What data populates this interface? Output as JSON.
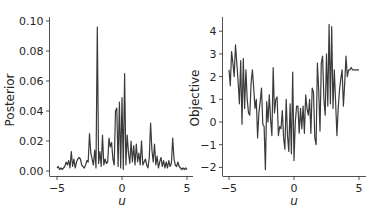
{
  "figure": {
    "title": "",
    "background": "#ffffff",
    "line_color": "#3a3a3a"
  },
  "chart_data": [
    {
      "type": "line",
      "title": "",
      "xlabel": "u",
      "ylabel": "Posterior",
      "xlim": [
        -5.1,
        5.2
      ],
      "ylim": [
        -0.002,
        0.1
      ],
      "xticks": [
        -5,
        0,
        5
      ],
      "xtick_labels": [
        "−5",
        "0",
        "5"
      ],
      "yticks": [
        0.0,
        0.02,
        0.04,
        0.06,
        0.08,
        0.1
      ],
      "ytick_labels": [
        "0.00",
        "0.02",
        "0.04",
        "0.06",
        "0.08",
        "0.10"
      ],
      "grid": false,
      "legend": null,
      "x": [
        -5.0,
        -4.9,
        -4.8,
        -4.7,
        -4.6,
        -4.5,
        -4.4,
        -4.3,
        -4.2,
        -4.1,
        -4.0,
        -3.9,
        -3.8,
        -3.7,
        -3.6,
        -3.5,
        -3.4,
        -3.3,
        -3.2,
        -3.1,
        -3.0,
        -2.9,
        -2.8,
        -2.7,
        -2.6,
        -2.5,
        -2.4,
        -2.3,
        -2.2,
        -2.1,
        -2.0,
        -1.9,
        -1.8,
        -1.7,
        -1.6,
        -1.5,
        -1.4,
        -1.3,
        -1.2,
        -1.1,
        -1.0,
        -0.9,
        -0.8,
        -0.7,
        -0.6,
        -0.5,
        -0.4,
        -0.3,
        -0.2,
        -0.1,
        0.0,
        0.1,
        0.2,
        0.3,
        0.4,
        0.5,
        0.6,
        0.7,
        0.8,
        0.9,
        1.0,
        1.1,
        1.2,
        1.3,
        1.4,
        1.5,
        1.6,
        1.7,
        1.8,
        1.9,
        2.0,
        2.1,
        2.2,
        2.3,
        2.4,
        2.5,
        2.6,
        2.7,
        2.8,
        2.9,
        3.0,
        3.1,
        3.2,
        3.3,
        3.4,
        3.5,
        3.6,
        3.7,
        3.8,
        3.9,
        4.0,
        4.1,
        4.2,
        4.3,
        4.4,
        4.5,
        4.6,
        4.7,
        4.8,
        4.9,
        5.0
      ],
      "values": [
        0.002,
        0.003,
        0.001,
        0.002,
        0.001,
        0.002,
        0.003,
        0.006,
        0.004,
        0.007,
        0.002,
        0.013,
        0.003,
        0.008,
        0.002,
        0.006,
        0.008,
        0.009,
        0.008,
        0.004,
        0.003,
        0.002,
        0.004,
        0.007,
        0.006,
        0.025,
        0.012,
        0.008,
        0.004,
        0.014,
        0.002,
        0.096,
        0.005,
        0.013,
        0.003,
        0.024,
        0.004,
        0.008,
        0.005,
        0.006,
        0.022,
        0.016,
        0.019,
        0.008,
        0.004,
        0.04,
        0.042,
        0.003,
        0.046,
        0.002,
        0.049,
        0.001,
        0.065,
        0.004,
        0.024,
        0.012,
        0.005,
        0.02,
        0.006,
        0.017,
        0.004,
        0.018,
        0.006,
        0.012,
        0.004,
        0.02,
        0.004,
        0.006,
        0.008,
        0.004,
        0.002,
        0.009,
        0.032,
        0.014,
        0.006,
        0.018,
        0.004,
        0.01,
        0.002,
        0.006,
        0.009,
        0.003,
        0.007,
        0.002,
        0.006,
        0.002,
        0.007,
        0.003,
        0.005,
        0.022,
        0.008,
        0.004,
        0.003,
        0.006,
        0.003,
        0.002,
        0.001,
        0.002,
        0.001,
        0.002,
        0.001
      ]
    },
    {
      "type": "line",
      "title": "",
      "xlabel": "u",
      "ylabel": "Objective",
      "xlim": [
        -5.5,
        5.5
      ],
      "ylim": [
        -2.4,
        4.6
      ],
      "xticks": [
        -5,
        0,
        5
      ],
      "xtick_labels": [
        "−5",
        "0",
        "5"
      ],
      "yticks": [
        -2,
        -1,
        0,
        1,
        2,
        3,
        4
      ],
      "ytick_labels": [
        "−2",
        "−1",
        "0",
        "1",
        "2",
        "3",
        "4"
      ],
      "grid": false,
      "legend": null,
      "x": [
        -5.0,
        -4.9,
        -4.8,
        -4.7,
        -4.6,
        -4.5,
        -4.4,
        -4.3,
        -4.2,
        -4.1,
        -4.0,
        -3.9,
        -3.8,
        -3.7,
        -3.6,
        -3.5,
        -3.4,
        -3.3,
        -3.2,
        -3.1,
        -3.0,
        -2.9,
        -2.8,
        -2.7,
        -2.6,
        -2.5,
        -2.4,
        -2.3,
        -2.2,
        -2.1,
        -2.0,
        -1.9,
        -1.8,
        -1.7,
        -1.6,
        -1.5,
        -1.4,
        -1.3,
        -1.2,
        -1.1,
        -1.0,
        -0.9,
        -0.8,
        -0.7,
        -0.6,
        -0.5,
        -0.4,
        -0.3,
        -0.2,
        -0.1,
        0.0,
        0.1,
        0.2,
        0.3,
        0.4,
        0.5,
        0.6,
        0.7,
        0.8,
        0.9,
        1.0,
        1.1,
        1.2,
        1.3,
        1.4,
        1.5,
        1.6,
        1.7,
        1.8,
        1.9,
        2.0,
        2.1,
        2.2,
        2.3,
        2.4,
        2.5,
        2.6,
        2.7,
        2.8,
        2.9,
        3.0,
        3.1,
        3.2,
        3.3,
        3.4,
        3.5,
        3.6,
        3.7,
        3.8,
        3.9,
        4.0,
        4.1,
        4.2,
        4.3,
        4.4,
        4.5,
        4.6,
        4.7,
        4.8,
        4.9,
        5.0
      ],
      "values": [
        2.3,
        1.6,
        3.1,
        2.6,
        2.0,
        3.4,
        2.6,
        1.8,
        0.8,
        2.7,
        -0.1,
        2.8,
        0.6,
        2.3,
        1.0,
        0.4,
        0.3,
        1.7,
        2.3,
        1.5,
        0.6,
        1.0,
        -0.7,
        0.4,
        0.9,
        1.5,
        -0.1,
        -0.2,
        -2.1,
        0.9,
        0.0,
        1.2,
        0.1,
        -0.6,
        2.4,
        0.4,
        1.0,
        1.1,
        -0.6,
        -0.2,
        -0.3,
        0.5,
        -0.7,
        -1.2,
        1.0,
        -0.6,
        -1.3,
        0.8,
        -1.4,
        2.2,
        -1.7,
        0.0,
        0.7,
        0.7,
        -0.5,
        0.6,
        -0.3,
        0.7,
        -0.5,
        1.2,
        0.6,
        0.3,
        1.0,
        -0.5,
        1.5,
        1.3,
        -0.7,
        -1.0,
        2.6,
        1.4,
        -0.4,
        2.6,
        2.9,
        1.0,
        0.3,
        3.0,
        0.7,
        4.3,
        0.8,
        4.2,
        0.6,
        2.3,
        0.9,
        -0.6,
        0.6,
        1.4,
        1.9,
        2.3,
        0.7,
        1.7,
        2.9,
        2.0,
        2.3,
        2.3,
        2.4,
        2.3,
        2.3,
        2.3,
        2.3,
        2.3,
        2.3
      ]
    }
  ]
}
